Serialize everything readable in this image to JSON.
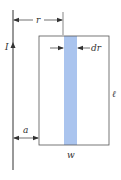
{
  "diagram": {
    "labels": {
      "current": "I",
      "distance_r": "r",
      "strip_width": "dr",
      "gap": "a",
      "width": "w",
      "length": "ℓ"
    },
    "colors": {
      "line": "#333333",
      "strip": "#aac4ee",
      "background": "#ffffff"
    },
    "elements": [
      "long-straight-wire",
      "current-arrow",
      "rectangular-loop",
      "shaded-strip",
      "r-dimension",
      "dr-dimension",
      "a-dimension"
    ]
  }
}
